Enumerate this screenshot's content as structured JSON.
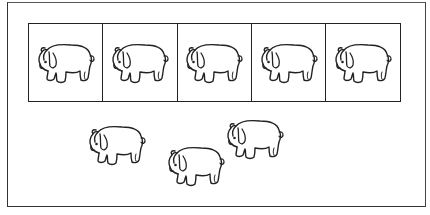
{
  "worksheet": {
    "boxed_row": {
      "box_count": 5,
      "items": [
        {
          "icon": "elephant-icon"
        },
        {
          "icon": "elephant-icon"
        },
        {
          "icon": "elephant-icon"
        },
        {
          "icon": "elephant-icon"
        },
        {
          "icon": "elephant-icon"
        }
      ]
    },
    "loose_group": {
      "count": 3,
      "items": [
        {
          "icon": "elephant-icon",
          "x": 84,
          "y": 122
        },
        {
          "icon": "elephant-icon",
          "x": 163,
          "y": 143
        },
        {
          "icon": "elephant-icon",
          "x": 222,
          "y": 116
        }
      ]
    },
    "colors": {
      "line": "#222222",
      "background": "#ffffff"
    }
  }
}
